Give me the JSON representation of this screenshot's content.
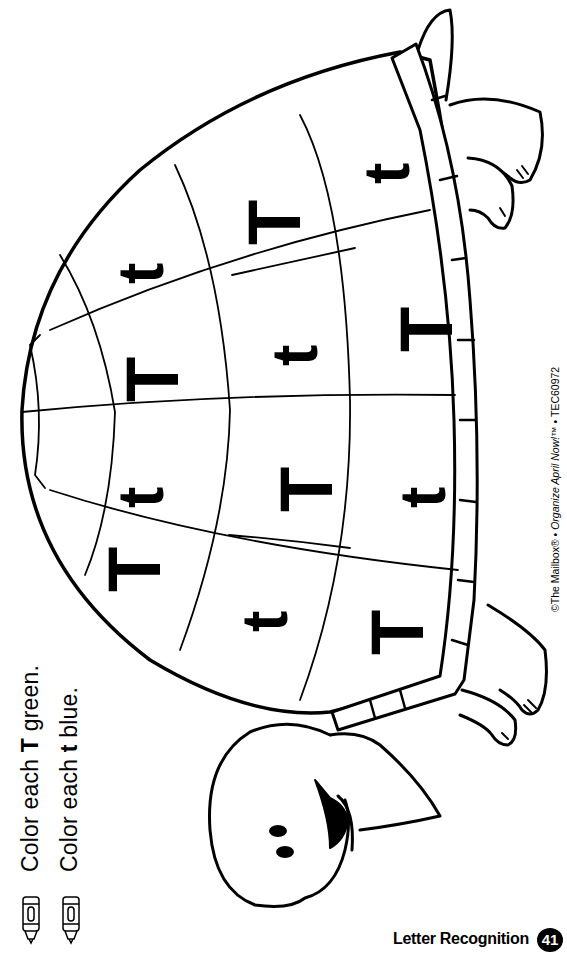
{
  "worksheet": {
    "instructions": [
      {
        "prefix": "Color each ",
        "letter": "T",
        "suffix": " green."
      },
      {
        "prefix": "Color each ",
        "letter": "t",
        "suffix": " blue."
      }
    ],
    "icons": [
      "crayon-icon",
      "crayon-icon"
    ],
    "copyright": {
      "prefix": "©The Mailbox® • ",
      "title": "Organize April Now!™",
      "suffix": " • TEC60972"
    },
    "footer": {
      "section_title": "Letter Recognition",
      "page_number": "41"
    },
    "shell_letters": {
      "row_top": [
        "T",
        "T",
        "t",
        "t"
      ],
      "row_middle": [
        "t",
        "T",
        "t",
        "T"
      ],
      "row_bottom": [
        "T",
        "t",
        "T",
        "t"
      ]
    },
    "colors": {
      "ink": "#000000",
      "paper": "#ffffff"
    }
  }
}
